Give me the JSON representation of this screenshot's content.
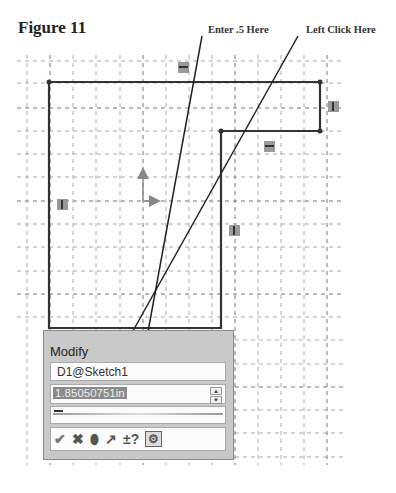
{
  "figure": {
    "title": "Figure 11"
  },
  "callouts": [
    {
      "label": "Enter .5 Here"
    },
    {
      "label": "Left Click Here"
    }
  ],
  "modify_dialog": {
    "title": "Modify",
    "dimension_name": "D1@Sketch1",
    "value": "1.85050751in",
    "spin_up": "▲",
    "spin_down": "▼",
    "tools": {
      "ok": "✔",
      "cancel": "✖",
      "rebuild": "⬮",
      "reverse": "↗",
      "mark_dim": "±?",
      "options": "⚙"
    }
  },
  "relations": [
    {
      "type": "horizontal"
    },
    {
      "type": "vertical"
    },
    {
      "type": "horizontal"
    },
    {
      "type": "vertical"
    },
    {
      "type": "vertical"
    }
  ]
}
